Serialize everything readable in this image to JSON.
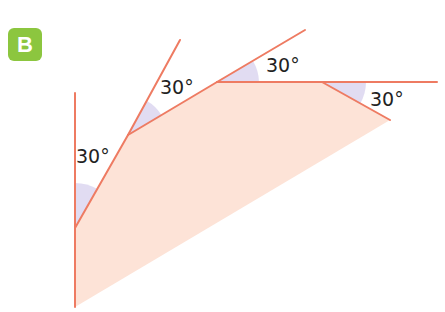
{
  "figure": {
    "label": "B",
    "colors": {
      "badge": "#8cc63f",
      "line": "#ee7b62",
      "fill": "#fde3d7",
      "angle_shade": "#dcd6f0",
      "text": "#222222"
    },
    "angles": [
      {
        "id": "angle-1",
        "label": "30°"
      },
      {
        "id": "angle-2",
        "label": "30°"
      },
      {
        "id": "angle-3",
        "label": "30°"
      },
      {
        "id": "angle-4",
        "label": "30°"
      }
    ]
  }
}
